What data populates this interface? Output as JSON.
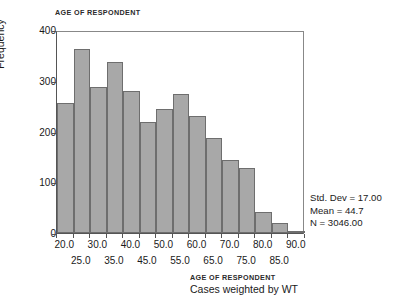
{
  "chart_data": {
    "type": "bar",
    "title": "AGE OF RESPONDENT",
    "xlabel": "AGE OF RESPONDENT",
    "ylabel": "Frequency",
    "caption": "Cases weighted by WT",
    "ylim": [
      0,
      400
    ],
    "xlim": [
      17.5,
      92.5
    ],
    "grid": false,
    "legend": null,
    "bin_width": 5,
    "yticks": [
      0,
      100,
      200,
      300,
      400
    ],
    "ytick_labels": [
      "0",
      "100",
      "200",
      "300",
      "400"
    ],
    "xtick_labels_row1": [
      "20.0",
      "30.0",
      "40.0",
      "50.0",
      "60.0",
      "70.0",
      "80.0",
      "90.0"
    ],
    "xtick_labels_row2": [
      "25.0",
      "35.0",
      "45.0",
      "55.0",
      "65.0",
      "75.0",
      "85.0"
    ],
    "xtick_values_row1": [
      20.0,
      30.0,
      40.0,
      50.0,
      60.0,
      70.0,
      80.0,
      90.0
    ],
    "xtick_values_row2": [
      25.0,
      35.0,
      45.0,
      55.0,
      65.0,
      75.0,
      85.0
    ],
    "bin_centers": [
      20.0,
      25.0,
      30.0,
      35.0,
      40.0,
      45.0,
      50.0,
      55.0,
      60.0,
      65.0,
      70.0,
      75.0,
      80.0,
      85.0,
      90.0
    ],
    "categories": [
      "17.5-22.5",
      "22.5-27.5",
      "27.5-32.5",
      "32.5-37.5",
      "37.5-42.5",
      "42.5-47.5",
      "47.5-52.5",
      "52.5-57.5",
      "57.5-62.5",
      "62.5-67.5",
      "67.5-72.5",
      "72.5-77.5",
      "77.5-82.5",
      "82.5-87.5",
      "87.5-92.5"
    ],
    "values": [
      256,
      362,
      287,
      336,
      280,
      218,
      245,
      274,
      231,
      188,
      144,
      128,
      42,
      20,
      2
    ],
    "bar_color": "#a8a8a8",
    "bar_edge_color": "#6e6e6e"
  },
  "stats": {
    "std_dev": "Std. Dev = 17.00",
    "mean": "Mean = 44.7",
    "n": "N = 3046.00"
  }
}
